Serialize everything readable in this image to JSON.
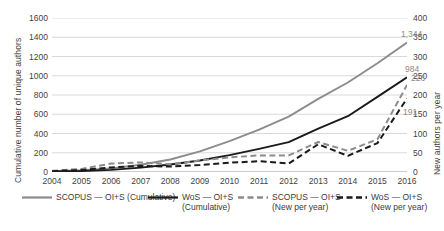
{
  "chart_data": {
    "type": "line",
    "title": "",
    "subtitle": "",
    "xlabel": "",
    "ylabel": "Cumulative number of unique authors",
    "y2label": "New authors per year",
    "grid": true,
    "legend_position": "bottom",
    "x": [
      2004,
      2005,
      2006,
      2007,
      2008,
      2009,
      2010,
      2011,
      2012,
      2013,
      2014,
      2015,
      2016
    ],
    "categories": [
      "2004",
      "2005",
      "2006",
      "2007",
      "2008",
      "2009",
      "2010",
      "2011",
      "2012",
      "2013",
      "2014",
      "2015",
      "2016"
    ],
    "ylim": [
      0,
      1600
    ],
    "ytick_labels": [
      "0",
      "200",
      "400",
      "600",
      "800",
      "1000",
      "1200",
      "1400",
      "1600"
    ],
    "yticks": [
      0,
      200,
      400,
      600,
      800,
      1000,
      1200,
      1400,
      1600
    ],
    "y2lim": [
      0,
      400
    ],
    "y2tick_labels": [
      "0",
      "50",
      "100",
      "150",
      "200",
      "250",
      "300",
      "350",
      "400"
    ],
    "y2ticks": [
      0,
      50,
      100,
      150,
      200,
      250,
      300,
      350,
      400
    ],
    "series": [
      {
        "name": "SCOPUS — OI+S (Cumulative)",
        "axis": "left",
        "style": "solid",
        "color": "#8c8c8c",
        "values": [
          8,
          18,
          38,
          75,
          130,
          215,
          320,
          440,
          575,
          760,
          930,
          1130,
          1344
        ],
        "end_label": "1,344"
      },
      {
        "name": "WoS — OI+S (Cumulative)",
        "axis": "left",
        "style": "solid",
        "color": "#1a1a1a",
        "values": [
          5,
          10,
          22,
          45,
          78,
          120,
          175,
          240,
          310,
          450,
          580,
          780,
          984
        ],
        "end_label": "984"
      },
      {
        "name": "SCOPUS — OI+S (New per year)",
        "axis": "right",
        "style": "dashed",
        "color": "#8c8c8c",
        "values": [
          3,
          8,
          22,
          25,
          20,
          30,
          38,
          43,
          43,
          78,
          55,
          85,
          226
        ],
        "end_label": "226"
      },
      {
        "name": "WoS — OI+S (New per year)",
        "axis": "right",
        "style": "dashed",
        "color": "#1a1a1a",
        "values": [
          2,
          5,
          12,
          16,
          14,
          18,
          24,
          28,
          22,
          72,
          42,
          75,
          191
        ],
        "end_label": "191"
      }
    ],
    "data_labels": [
      {
        "text": "1,344",
        "color": "#8c8c8c"
      },
      {
        "text": "984",
        "color": "#8c8c8c"
      },
      {
        "text": "226",
        "color": "#8c8c8c"
      },
      {
        "text": "191",
        "color": "#8c8c8c"
      }
    ]
  },
  "legend": {
    "items": [
      {
        "label_line1": "SCOPUS — OI+S (Cumulative)",
        "label_line2": "",
        "color": "#8c8c8c",
        "style": "solid"
      },
      {
        "label_line1": "WoS — OI+S",
        "label_line2": "(Cumulative)",
        "color": "#1a1a1a",
        "style": "solid"
      },
      {
        "label_line1": "SCOPUS — OI+S",
        "label_line2": "(New per year)",
        "color": "#8c8c8c",
        "style": "dashed"
      },
      {
        "label_line1": "WoS — OI+S",
        "label_line2": "(New per year)",
        "color": "#1a1a1a",
        "style": "dashed"
      }
    ]
  },
  "colors": {
    "scopus": "#8c8c8c",
    "wos": "#1a1a1a",
    "grid": "#c9c9c9",
    "text": "#3f3f3f",
    "background": "#ffffff"
  }
}
